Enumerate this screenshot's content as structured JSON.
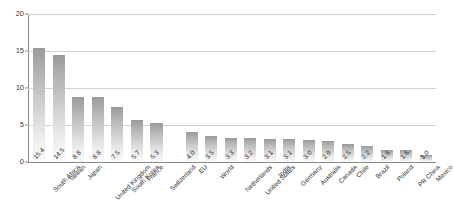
{
  "chart_data": {
    "type": "bar",
    "title": "",
    "subtitle": "",
    "xlabel": "",
    "ylabel": "",
    "ylim": [
      0,
      20
    ],
    "yticks": [
      "0",
      "5",
      "10",
      "15",
      "20"
    ],
    "ytick_values": [
      0,
      5,
      10,
      15,
      20
    ],
    "grid": true,
    "legend": "none",
    "orientation": "vertical",
    "group_gap_after": "Switzerland",
    "categories": [
      "South Africa",
      "Taiwan",
      "Japan",
      "United Kingdom",
      "South Korea",
      "France",
      "Switzerland",
      "EU",
      "World",
      "Netherlands",
      "United States",
      "India",
      "Germany",
      "Australia",
      "Canada",
      "Chile",
      "Brazil",
      "Poland",
      "PR China",
      "Mexico"
    ],
    "values": [
      15.4,
      14.5,
      8.8,
      8.8,
      7.5,
      5.7,
      5.3,
      4.0,
      3.5,
      3.3,
      3.2,
      3.1,
      3.1,
      3.0,
      2.9,
      2.5,
      2.2,
      1.6,
      1.6,
      1.0
    ],
    "value_labels": [
      "15.4",
      "14.5",
      "8.8",
      "8.8",
      "7.5",
      "5.7",
      "5.3",
      "4.0",
      "3.5",
      "3.3",
      "3.2",
      "3.1",
      "3.1",
      "3.0",
      "2.9",
      "2.5",
      "2.2",
      "1.6",
      "1.6",
      "1.0"
    ],
    "colors": {
      "bar_top": "#9a9a9a",
      "bar_bottom": "#fafafa",
      "gridline": "#d2d2d2",
      "axis": "#8a8a8a",
      "text": "#2b2b2b",
      "background": "#ffffff"
    }
  }
}
